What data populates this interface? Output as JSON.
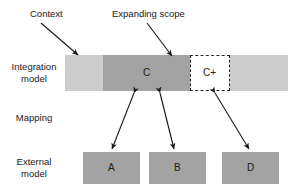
{
  "diagram": {
    "title_text_present": false,
    "callouts": [
      {
        "id": "context",
        "label": "Context"
      },
      {
        "id": "expanding-scope",
        "label": "Expanding scope"
      }
    ],
    "row_labels": [
      {
        "id": "integration-model",
        "line1": "Integration",
        "line2": "model"
      },
      {
        "id": "mapping",
        "line1": "Mapping",
        "line2": ""
      },
      {
        "id": "external-model",
        "line1": "External",
        "line2": "model"
      }
    ],
    "integration_layer": {
      "context_band_label": "",
      "scope_box_label": "C",
      "expanded_box_label": "C+"
    },
    "external_layer": {
      "boxes": [
        {
          "id": "a",
          "label": "A"
        },
        {
          "id": "b",
          "label": "B"
        },
        {
          "id": "d",
          "label": "D"
        }
      ]
    },
    "colors": {
      "context_band": "#cccccc",
      "scope_box": "#a3a3a3",
      "external_box": "#a3a3a3",
      "expanded_box_fill": "#ffffff",
      "expanded_box_border": "#262626",
      "arrow": "#1a1a1a",
      "text": "#1a1a1a",
      "background": "#ffffff"
    }
  }
}
